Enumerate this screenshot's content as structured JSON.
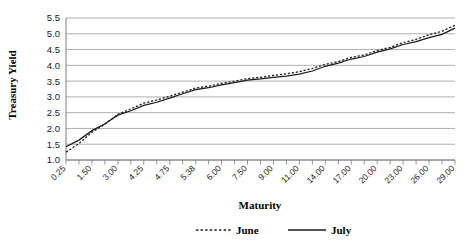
{
  "chart_data": {
    "type": "line",
    "title": "",
    "xlabel": "Maturity",
    "ylabel": "Treasury Yield",
    "ylim": [
      1.0,
      5.5
    ],
    "ytick_values": [
      1.0,
      1.5,
      2.0,
      2.5,
      3.0,
      3.5,
      4.0,
      4.5,
      5.0,
      5.5
    ],
    "ytick_labels": [
      "1.0",
      "1.5",
      "2.0",
      "2.5",
      "3.0",
      "3.5",
      "4.0",
      "4.5",
      "5.0",
      "5.5"
    ],
    "grid": true,
    "legend_position": "bottom",
    "categories": [
      "0.25",
      "0.50",
      "1.50",
      "2.00",
      "3.00",
      "3.50",
      "4.25",
      "4.50",
      "4.75",
      "5.00",
      "5.38",
      "5.50",
      "6.00",
      "6.50",
      "7.50",
      "8.00",
      "9.00",
      "10.00",
      "11.00",
      "12.00",
      "14.00",
      "15.00",
      "17.00",
      "18.00",
      "20.00",
      "21.00",
      "23.00",
      "24.00",
      "26.00",
      "27.00",
      "29.00"
    ],
    "xtick_labels_shown": [
      "0.25",
      "1.50",
      "3.00",
      "4.25",
      "4.75",
      "5.38",
      "6.00",
      "7.50",
      "9.00",
      "11.00",
      "14.00",
      "17.00",
      "20.00",
      "23.00",
      "26.00",
      "29.00"
    ],
    "series": [
      {
        "name": "June",
        "style": "dotted",
        "color": "#1a1a1a",
        "values": [
          1.25,
          1.52,
          1.88,
          2.13,
          2.45,
          2.62,
          2.8,
          2.9,
          3.02,
          3.15,
          3.28,
          3.34,
          3.43,
          3.5,
          3.58,
          3.62,
          3.68,
          3.73,
          3.8,
          3.9,
          4.03,
          4.12,
          4.25,
          4.33,
          4.47,
          4.57,
          4.72,
          4.82,
          4.97,
          5.08,
          5.27
        ]
      },
      {
        "name": "July",
        "style": "solid",
        "color": "#1a1a1a",
        "values": [
          1.42,
          1.63,
          1.93,
          2.15,
          2.42,
          2.56,
          2.73,
          2.83,
          2.96,
          3.1,
          3.23,
          3.29,
          3.38,
          3.45,
          3.53,
          3.57,
          3.62,
          3.66,
          3.72,
          3.82,
          3.97,
          4.07,
          4.2,
          4.28,
          4.42,
          4.52,
          4.66,
          4.75,
          4.88,
          4.98,
          5.18
        ]
      }
    ]
  },
  "legend": {
    "items": [
      {
        "label": "June",
        "style": "dotted"
      },
      {
        "label": "July",
        "style": "solid"
      }
    ]
  }
}
